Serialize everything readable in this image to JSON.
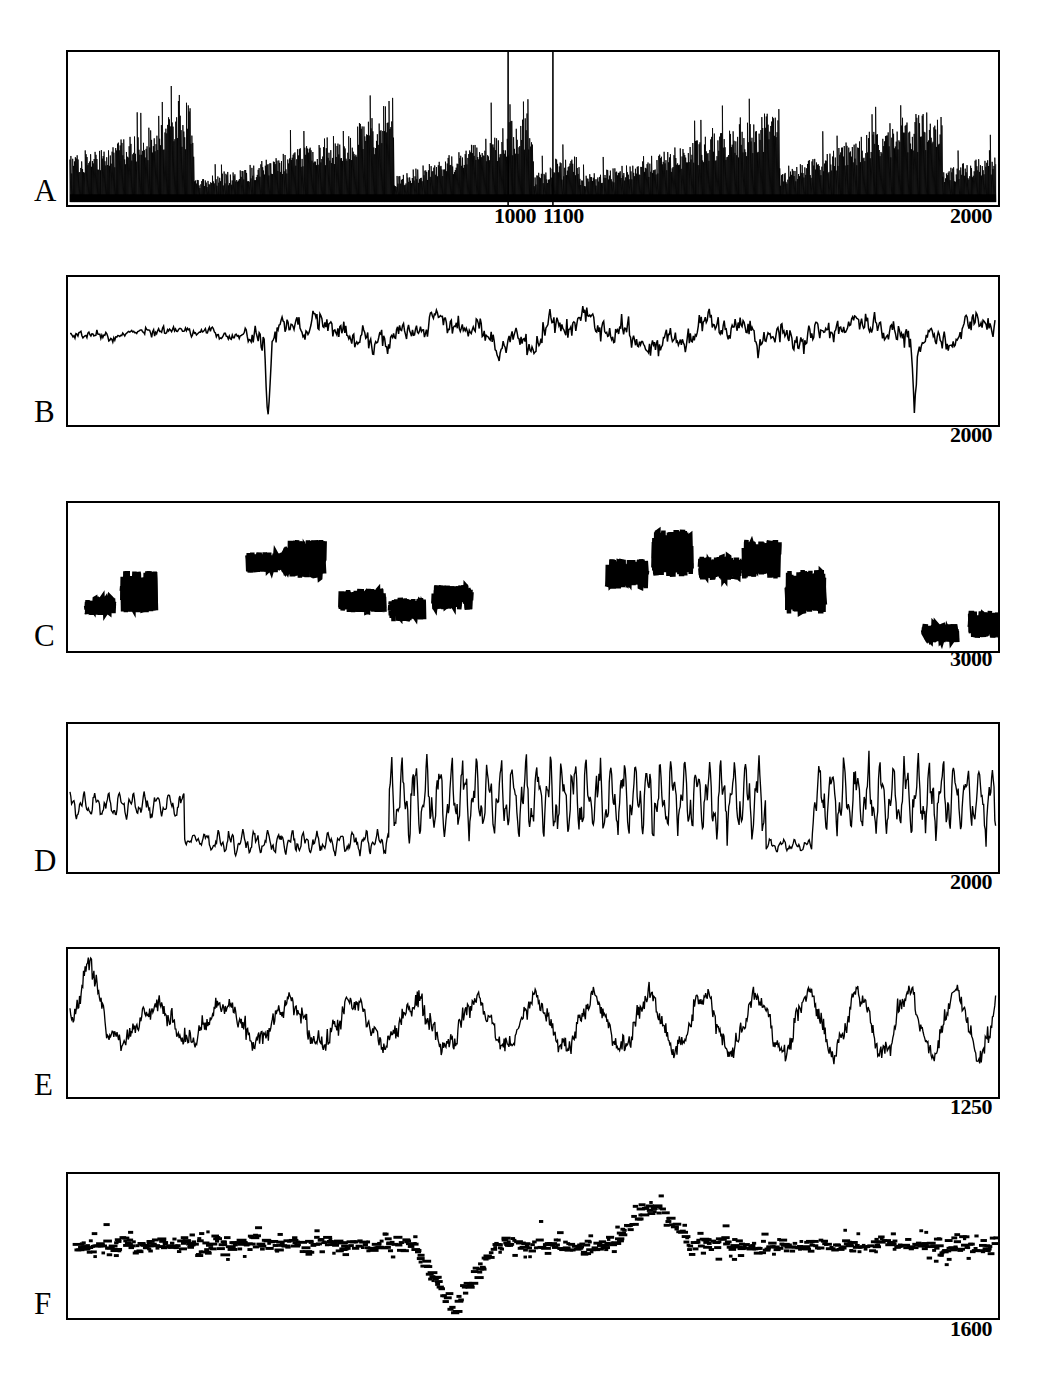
{
  "figure": {
    "panels": [
      {
        "letter": "A",
        "right_label": "2000",
        "inner_labels": [
          "1000",
          "1100"
        ],
        "inner_tick_values": [
          1000,
          1100
        ],
        "kind": "spike-train-sawtooth"
      },
      {
        "letter": "B",
        "right_label": "2000",
        "inner_labels": [],
        "inner_tick_values": [],
        "kind": "noisy-waveform"
      },
      {
        "letter": "C",
        "right_label": "3000",
        "inner_labels": [],
        "inner_tick_values": [],
        "kind": "sparse-burst-clusters"
      },
      {
        "letter": "D",
        "right_label": "2000",
        "inner_labels": [],
        "inner_tick_values": [],
        "kind": "regime-switching-oscillation"
      },
      {
        "letter": "E",
        "right_label": "1250",
        "inner_labels": [],
        "inner_tick_values": [],
        "kind": "quasi-periodic-noisy"
      },
      {
        "letter": "F",
        "right_label": "1600",
        "inner_labels": [],
        "inner_tick_values": [],
        "kind": "discrete-dot-scatter"
      }
    ]
  },
  "chart_data": [
    {
      "type": "line",
      "panel": "A",
      "title": "",
      "xlabel": "",
      "ylabel": "",
      "xlim": [
        0,
        2000
      ],
      "ylim": [
        0,
        1
      ],
      "grid": false,
      "legend": null,
      "tick_labels": [
        "1000",
        "1100",
        "2000"
      ],
      "tick_values": [
        1000,
        1100,
        2000
      ],
      "description": "Dense spike train with repeating sawtooth amplitude envelopes; amplitude ramps up then resets abruptly. Five envelope segments with reset points.",
      "envelope_resets": [
        270,
        700,
        1000,
        1100,
        1530,
        1880
      ],
      "series": [
        {
          "name": "spike-amplitude-envelope",
          "x": [
            0,
            80,
            160,
            240,
            268,
            272,
            360,
            460,
            560,
            660,
            698,
            702,
            800,
            900,
            998,
            1002,
            1060,
            1098,
            1102,
            1200,
            1320,
            1440,
            1528,
            1532,
            1620,
            1740,
            1860,
            1878,
            1882,
            1950,
            2000
          ],
          "values": [
            0.34,
            0.4,
            0.5,
            0.62,
            0.72,
            0.16,
            0.22,
            0.34,
            0.46,
            0.6,
            0.76,
            0.18,
            0.3,
            0.46,
            0.66,
            0.2,
            0.28,
            0.34,
            0.18,
            0.26,
            0.4,
            0.54,
            0.68,
            0.2,
            0.34,
            0.52,
            0.66,
            0.74,
            0.22,
            0.3,
            0.36
          ]
        }
      ]
    },
    {
      "type": "line",
      "panel": "B",
      "title": "",
      "xlabel": "",
      "ylabel": "",
      "xlim": [
        0,
        2000
      ],
      "ylim": [
        0,
        1
      ],
      "grid": false,
      "legend": null,
      "tick_labels": [
        "2000"
      ],
      "tick_values": [
        2000
      ],
      "description": "Irregular noisy waveform oscillating about a mid-level baseline; quiet low-variance start, then larger excursions including a deep single downward spike near x=430 and another near x=1820.",
      "series": [
        {
          "name": "signal",
          "baseline": 0.62,
          "noise_amplitude": 0.07,
          "event_spikes": [
            {
              "x": 430,
              "depth": -0.58
            },
            {
              "x": 1820,
              "depth": -0.42
            }
          ]
        }
      ]
    },
    {
      "type": "scatter",
      "panel": "C",
      "title": "",
      "xlabel": "",
      "ylabel": "",
      "xlim": [
        0,
        3000
      ],
      "ylim": [
        0,
        1
      ],
      "grid": false,
      "legend": null,
      "tick_labels": [
        "3000"
      ],
      "tick_values": [
        3000
      ],
      "description": "Sparse isolated dense burst clusters separated by long silent gaps; 15 clusters of short erratic excursions at varying heights.",
      "clusters": [
        {
          "x": 60,
          "y": 0.3,
          "w": 28,
          "h": 0.12
        },
        {
          "x": 175,
          "y": 0.4,
          "w": 34,
          "h": 0.28
        },
        {
          "x": 580,
          "y": 0.6,
          "w": 44,
          "h": 0.14
        },
        {
          "x": 700,
          "y": 0.62,
          "w": 40,
          "h": 0.26
        },
        {
          "x": 880,
          "y": 0.34,
          "w": 44,
          "h": 0.16
        },
        {
          "x": 1040,
          "y": 0.28,
          "w": 34,
          "h": 0.16
        },
        {
          "x": 1180,
          "y": 0.36,
          "w": 38,
          "h": 0.17
        },
        {
          "x": 1740,
          "y": 0.52,
          "w": 40,
          "h": 0.2
        },
        {
          "x": 1890,
          "y": 0.66,
          "w": 38,
          "h": 0.32
        },
        {
          "x": 2040,
          "y": 0.56,
          "w": 40,
          "h": 0.16
        },
        {
          "x": 2180,
          "y": 0.62,
          "w": 36,
          "h": 0.26
        },
        {
          "x": 2320,
          "y": 0.4,
          "w": 38,
          "h": 0.3
        },
        {
          "x": 2760,
          "y": 0.12,
          "w": 34,
          "h": 0.12
        },
        {
          "x": 2910,
          "y": 0.18,
          "w": 30,
          "h": 0.18
        }
      ]
    },
    {
      "type": "line",
      "panel": "D",
      "title": "",
      "xlabel": "",
      "ylabel": "",
      "xlim": [
        0,
        2000
      ],
      "ylim": [
        0,
        1
      ],
      "grid": false,
      "legend": null,
      "tick_labels": [
        "2000"
      ],
      "tick_values": [
        2000
      ],
      "description": "Regime-switching oscillation: moderate amplitude at a higher level, abrupt drop to a low quiet regime, then a sustained high-amplitude regime, a brief quiet dip near x=1540, and a final high-amplitude regime.",
      "regimes": [
        {
          "start": 0,
          "end": 250,
          "level": 0.45,
          "amplitude": 0.1
        },
        {
          "start": 250,
          "end": 300,
          "level": 0.22,
          "amplitude": 0.05
        },
        {
          "start": 300,
          "end": 690,
          "level": 0.2,
          "amplitude": 0.09
        },
        {
          "start": 690,
          "end": 1500,
          "level": 0.5,
          "amplitude": 0.3
        },
        {
          "start": 1500,
          "end": 1600,
          "level": 0.18,
          "amplitude": 0.05
        },
        {
          "start": 1600,
          "end": 2000,
          "level": 0.5,
          "amplitude": 0.28
        }
      ]
    },
    {
      "type": "line",
      "panel": "E",
      "title": "",
      "xlabel": "",
      "ylabel": "",
      "xlim": [
        0,
        1250
      ],
      "ylim": [
        0,
        1
      ],
      "grid": false,
      "legend": null,
      "tick_labels": [
        "1250"
      ],
      "tick_values": [
        1250
      ],
      "description": "Quasi-periodic noisy waveform with a large opening peak, an irregular middle section, and increasingly regular large slow oscillations toward the right end.",
      "series": [
        {
          "name": "signal",
          "baseline": 0.5,
          "slow_period_start": 95,
          "slow_period_end": 62,
          "slow_amplitude_start": 0.1,
          "slow_amplitude_end": 0.22,
          "noise_amplitude": 0.07,
          "opening_peak": {
            "x": 30,
            "height": 0.86
          }
        }
      ]
    },
    {
      "type": "scatter",
      "panel": "F",
      "title": "",
      "xlabel": "",
      "ylabel": "",
      "xlim": [
        0,
        1600
      ],
      "ylim": [
        0,
        1
      ],
      "grid": false,
      "legend": null,
      "tick_labels": [
        "1600"
      ],
      "tick_values": [
        1600
      ],
      "description": "Dense discrete dot/dash scatter forming a quantized time series; values cluster in horizontal bands around mid-height, with a pronounced dip near x=620-700 reaching the lower boundary and a tall excursion near x=980-1030.",
      "band_levels": [
        0.18,
        0.28,
        0.38,
        0.46,
        0.54,
        0.62,
        0.7,
        0.8
      ],
      "series": [
        {
          "name": "quantized-signal",
          "baseline": 0.52,
          "dip": {
            "x": 660,
            "depth": 0.08
          },
          "peak": {
            "x": 1000,
            "height": 0.88
          },
          "marker": "dash"
        }
      ]
    }
  ]
}
